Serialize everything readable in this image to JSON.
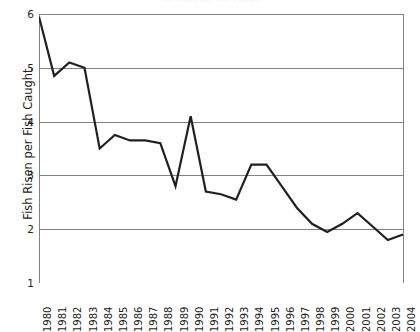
{
  "chart_data": {
    "type": "line",
    "title": "Fish Risen per Fish Caught",
    "xlabel": "",
    "ylabel": "Fish Risen per Fish Caught",
    "xlim": [
      1980,
      2004
    ],
    "ylim": [
      1,
      6
    ],
    "yticks": [
      1,
      2,
      3,
      4,
      5,
      6
    ],
    "ytick_labels": [
      "1",
      "2",
      "3",
      "4",
      "5",
      "6"
    ],
    "grid": true,
    "grid_axis": "y",
    "legend": false,
    "legend_position": "none",
    "line_color": "#231f20",
    "line_width": 2.2,
    "background": "#ffffff",
    "categories": [
      "1980",
      "1981",
      "1982",
      "1983",
      "1984",
      "1985",
      "1986",
      "1987",
      "1988",
      "1989",
      "1990",
      "1991",
      "1992",
      "1993",
      "1994",
      "1995",
      "1996",
      "1997",
      "1998",
      "1999",
      "2000",
      "2001",
      "2002",
      "2003",
      "2004"
    ],
    "x": [
      1980,
      1981,
      1982,
      1983,
      1984,
      1985,
      1986,
      1987,
      1988,
      1989,
      1990,
      1991,
      1992,
      1993,
      1994,
      1995,
      1996,
      1997,
      1998,
      1999,
      2000,
      2001,
      2002,
      2003,
      2004
    ],
    "values": [
      5.95,
      4.85,
      5.1,
      5.0,
      3.5,
      3.75,
      3.65,
      3.65,
      3.6,
      2.8,
      4.1,
      2.7,
      2.65,
      2.55,
      3.2,
      3.2,
      2.8,
      2.4,
      2.1,
      1.95,
      2.1,
      2.3,
      2.05,
      1.8,
      1.9
    ],
    "series": [
      {
        "name": "Fish Risen per Fish Caught",
        "values": [
          5.95,
          4.85,
          5.1,
          5.0,
          3.5,
          3.75,
          3.65,
          3.65,
          3.6,
          2.8,
          4.1,
          2.7,
          2.65,
          2.55,
          3.2,
          3.2,
          2.8,
          2.4,
          2.1,
          1.95,
          2.1,
          2.3,
          2.05,
          1.8,
          1.9
        ]
      }
    ]
  }
}
